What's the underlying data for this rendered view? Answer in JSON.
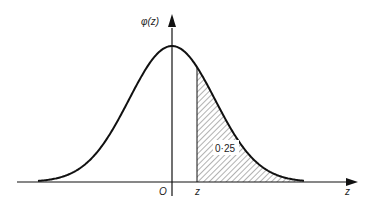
{
  "figure": {
    "y_axis_label": "φ(z)",
    "x_axis_label": "z",
    "origin_label": "O",
    "z_marker_label": "z",
    "shaded_area_label": "0·25"
  },
  "chart_data": {
    "type": "area",
    "title": "",
    "xlabel": "z",
    "ylabel": "φ(z)",
    "curve": "normal density",
    "origin": "O",
    "marker": "z",
    "shaded_region": "z to +∞",
    "shaded_area": 0.25,
    "annotations": [
      "0·25"
    ],
    "grid": false,
    "legend": null
  },
  "colors": {
    "line": "#111111",
    "hatch": "#555555",
    "background": "#ffffff"
  }
}
